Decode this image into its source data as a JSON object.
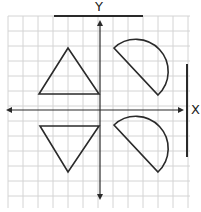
{
  "labels": {
    "y_axis": "Y",
    "x_axis": "X"
  },
  "colors": {
    "grid": "#d4d4d4",
    "stroke": "#2a2a2a",
    "background": "#ffffff"
  },
  "grid": {
    "x0": 8,
    "y0": 16,
    "x1": 190,
    "y1": 208,
    "cell": 15
  },
  "axes": {
    "origin": [
      100,
      110
    ],
    "x_axis": {
      "from": [
        6,
        110
      ],
      "to": [
        184,
        110
      ]
    },
    "y_axis": {
      "from": [
        100,
        20
      ],
      "to": [
        100,
        200
      ]
    }
  },
  "mirror_lines": {
    "horizontal_bar": {
      "from": [
        54,
        16
      ],
      "to": [
        143,
        16
      ]
    },
    "vertical_bar": {
      "from": [
        187,
        64
      ],
      "to": [
        187,
        157
      ]
    }
  },
  "shapes": [
    {
      "type": "triangle",
      "name": "upper-triangle",
      "points": [
        [
          68,
          48
        ],
        [
          39,
          94
        ],
        [
          99,
          94
        ]
      ]
    },
    {
      "type": "triangle",
      "name": "lower-triangle",
      "points": [
        [
          40,
          126
        ],
        [
          99,
          126
        ],
        [
          68,
          172
        ]
      ]
    },
    {
      "type": "semicircle",
      "name": "upper-semicircle",
      "diameter": [
        [
          114,
          48
        ],
        [
          158,
          95
        ]
      ]
    },
    {
      "type": "semicircle",
      "name": "lower-semicircle",
      "diameter": [
        [
          114,
          125
        ],
        [
          158,
          172
        ]
      ]
    }
  ]
}
